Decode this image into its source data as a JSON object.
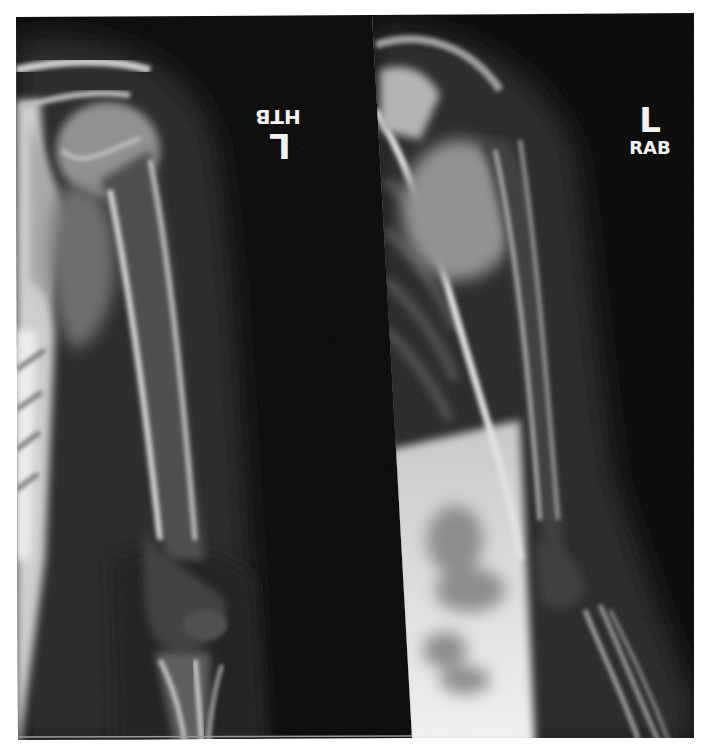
{
  "figure": {
    "background_color": "#ffffff",
    "film_color": "#050505"
  },
  "panels": [
    {
      "id": "left",
      "marker": {
        "letter": "L",
        "label": "HTB",
        "orientation": "rotated-180"
      }
    },
    {
      "id": "right",
      "marker": {
        "letter": "L",
        "label": "RAB",
        "orientation": "upright"
      }
    }
  ]
}
